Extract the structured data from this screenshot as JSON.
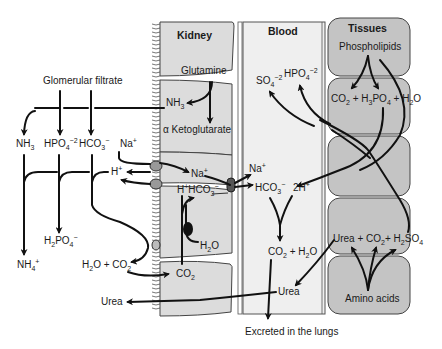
{
  "regions": {
    "kidney": "Kidney",
    "blood": "Blood",
    "tissues": "Tissues"
  },
  "labels": {
    "glomerular_filtrate": "Glomerular filtrate",
    "glutamine": "Glutamine",
    "nh3_kidney": "NH",
    "alpha_ketoglutarate": "α Ketoglutarate",
    "nh3_filtrate": "NH",
    "hpo4_filtrate": "HPO",
    "hco3_filtrate": "HCO",
    "na_filtrate": "Na",
    "h_plus_filtrate": "H",
    "h2po4": "H",
    "nh4": "NH",
    "h2o_co2_lumen": "H",
    "urea_out": "Urea",
    "na_cell": "Na",
    "h_hco3_cell": "H",
    "h2o_cell": "H",
    "co2_cell": "CO",
    "na_blood": "Na",
    "hco3_blood": "HCO",
    "two_h_plus": "2H",
    "so4_blood": "SO",
    "hpo4_blood": "HPO",
    "co2_h2o_blood": "CO",
    "urea_blood": "Urea",
    "excreted": "Excreted in the lungs",
    "phospholipids": "Phospholipids",
    "co2_h3po4_h2o": "CO",
    "urea_co2_h2so4": "Urea  +  CO",
    "amino_acids": "Amino acids"
  },
  "colors": {
    "kidney_fill": "#dcdcdc",
    "blood_fill": "#efefef",
    "tissue_fill": "#c4c4c4",
    "stroke": "#111111"
  }
}
